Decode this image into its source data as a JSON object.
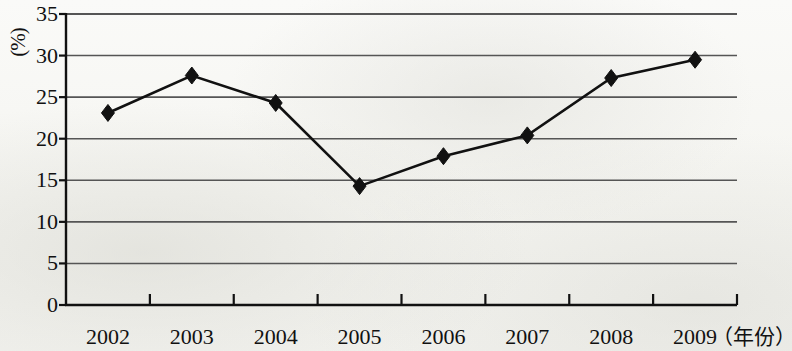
{
  "chart_data": {
    "type": "line",
    "title": "",
    "subtitle": "",
    "xlabel": "（年份）",
    "ylabel": "(%)",
    "categories": [
      "2002",
      "2003",
      "2004",
      "2005",
      "2006",
      "2007",
      "2008",
      "2009"
    ],
    "values": [
      23.1,
      27.6,
      24.3,
      14.3,
      17.9,
      20.4,
      27.3,
      29.5
    ],
    "series": [
      {
        "name": "",
        "values": [
          23.1,
          27.6,
          24.3,
          14.3,
          17.9,
          20.4,
          27.3,
          29.5
        ]
      }
    ],
    "ylim": [
      0,
      35
    ],
    "ytick_labels": [
      "0",
      "5",
      "10",
      "15",
      "20",
      "25",
      "30",
      "35"
    ],
    "ytick_values": [
      0,
      5,
      10,
      15,
      20,
      25,
      30,
      35
    ],
    "grid": true,
    "grid_axis": "y",
    "legend": false,
    "legend_position": "none",
    "marker": "diamond",
    "line_color": "#111111",
    "marker_color": "#111111",
    "grid_color": "#555555",
    "axis_color": "#111111",
    "background_color": "#f7f7f4",
    "annotations": []
  },
  "axis": {
    "y_unit_label": "(%)",
    "x_unit_label": "（年份）"
  }
}
